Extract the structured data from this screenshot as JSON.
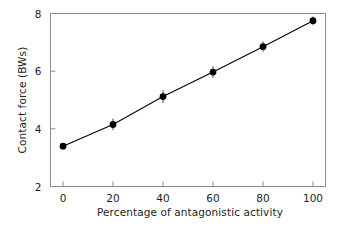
{
  "chart_data": {
    "type": "line",
    "title": "",
    "subtitle": "",
    "xlabel": "Percentage of antagonistic activity",
    "ylabel": "Contact force (BWs)",
    "x": [
      0,
      20,
      40,
      60,
      80,
      100
    ],
    "values": [
      3.4,
      4.15,
      5.12,
      5.97,
      6.85,
      7.75
    ],
    "errors": [
      0.0,
      0.2,
      0.22,
      0.2,
      0.18,
      0.15
    ],
    "xlim": [
      -5,
      105
    ],
    "ylim": [
      2,
      8
    ],
    "xticks": [
      0,
      20,
      40,
      60,
      80,
      100
    ],
    "yticks": [
      2,
      4,
      6,
      8
    ],
    "xtick_labels": [
      "0",
      "20",
      "40",
      "60",
      "80",
      "100"
    ],
    "ytick_labels": [
      "2",
      "4",
      "6",
      "8"
    ],
    "grid": false,
    "legend": null,
    "legend_position": "none",
    "series": [
      {
        "name": "Contact force",
        "marker": "filled-circle",
        "marker_color": "#000000",
        "line_color": "#000000",
        "errorbar_color": "#555555",
        "x": [
          0,
          20,
          40,
          60,
          80,
          100
        ],
        "values": [
          3.4,
          4.15,
          5.12,
          5.97,
          6.85,
          7.75
        ],
        "errors": [
          0.0,
          0.2,
          0.22,
          0.2,
          0.18,
          0.15
        ]
      }
    ],
    "axis_color": "#8c8c8c",
    "text_color": "#231f20"
  },
  "figure": {
    "background": "#ffffff"
  }
}
